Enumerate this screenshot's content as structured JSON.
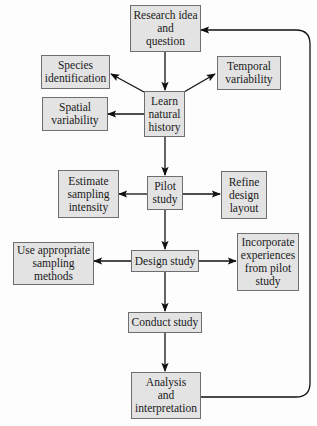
{
  "diagram": {
    "nodes": [
      {
        "id": "research",
        "label": "Research idea\nand\nquestion"
      },
      {
        "id": "species",
        "label": "Species\nidentification"
      },
      {
        "id": "temporal",
        "label": "Temporal\nvariability"
      },
      {
        "id": "spatial",
        "label": "Spatial\nvariability"
      },
      {
        "id": "learn",
        "label": "Learn\nnatural\nhistory"
      },
      {
        "id": "estimate",
        "label": "Estimate\nsampling\nintensity"
      },
      {
        "id": "pilot",
        "label": "Pilot\nstudy"
      },
      {
        "id": "refine",
        "label": "Refine\ndesign\nlayout"
      },
      {
        "id": "use",
        "label": "Use appropriate\nsampling\nmethods"
      },
      {
        "id": "design",
        "label": "Design study"
      },
      {
        "id": "incorporate",
        "label": "Incorporate\nexperiences\nfrom pilot\nstudy"
      },
      {
        "id": "conduct",
        "label": "Conduct study"
      },
      {
        "id": "analysis",
        "label": "Analysis\nand\ninterpretation"
      }
    ],
    "edges": [
      {
        "from": "research",
        "to": "learn"
      },
      {
        "from": "learn",
        "to": "species"
      },
      {
        "from": "learn",
        "to": "temporal"
      },
      {
        "from": "learn",
        "to": "spatial"
      },
      {
        "from": "learn",
        "to": "pilot"
      },
      {
        "from": "pilot",
        "to": "estimate"
      },
      {
        "from": "pilot",
        "to": "refine"
      },
      {
        "from": "pilot",
        "to": "design"
      },
      {
        "from": "design",
        "to": "use"
      },
      {
        "from": "design",
        "to": "incorporate"
      },
      {
        "from": "design",
        "to": "conduct"
      },
      {
        "from": "conduct",
        "to": "analysis"
      },
      {
        "from": "analysis",
        "to": "research"
      }
    ],
    "colors": {
      "box_fill": "#e3e3e3",
      "box_border": "#6f6f6f",
      "arrow": "#111111",
      "background": "#fdfdfd"
    }
  }
}
